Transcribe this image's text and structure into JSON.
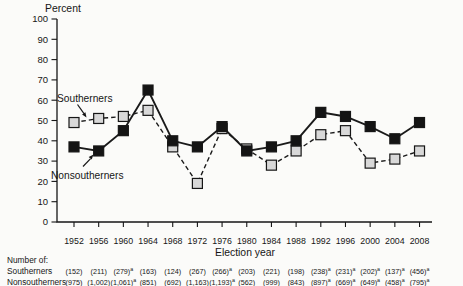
{
  "page": {
    "background": "#fbfbf9",
    "ink_color": "#161616",
    "gray_marker_color": "#d8d8d8"
  },
  "chart_data": {
    "type": "line",
    "title": "",
    "ylabel": "Percent",
    "xlabel": "Election year",
    "ylim": [
      0,
      100
    ],
    "ytick_step": 10,
    "grid": false,
    "legend_position": "inline-annotations",
    "categories": [
      "1952",
      "1956",
      "1960",
      "1964",
      "1968",
      "1972",
      "1976",
      "1980",
      "1984",
      "1988",
      "1992",
      "1996",
      "2000",
      "2004",
      "2008"
    ],
    "series": [
      {
        "name": "Southerners",
        "line_style": "dashed",
        "marker": "square",
        "marker_fill": "#d8d8d8",
        "line_color": "#1a1a1a",
        "values": [
          49,
          51,
          52,
          55,
          37,
          19,
          46,
          36,
          28,
          35,
          43,
          45,
          29,
          31,
          35
        ]
      },
      {
        "name": "Nonsoutherners",
        "line_style": "solid",
        "marker": "square",
        "marker_fill": "#141414",
        "line_color": "#1a1a1a",
        "values": [
          37,
          35,
          45,
          65,
          40,
          37,
          47,
          35,
          37,
          40,
          54,
          52,
          47,
          41,
          49
        ]
      }
    ]
  },
  "footnote_table": {
    "heading": "Number of:",
    "rows": [
      {
        "label": "Southerners",
        "values": [
          {
            "text": "(152)",
            "sup": ""
          },
          {
            "text": "(211)",
            "sup": ""
          },
          {
            "text": "(279)",
            "sup": "a"
          },
          {
            "text": "(163)",
            "sup": ""
          },
          {
            "text": "(124)",
            "sup": ""
          },
          {
            "text": "(267)",
            "sup": ""
          },
          {
            "text": "(266)",
            "sup": "a"
          },
          {
            "text": "(203)",
            "sup": ""
          },
          {
            "text": "(221)",
            "sup": ""
          },
          {
            "text": "(198)",
            "sup": ""
          },
          {
            "text": "(238)",
            "sup": "a"
          },
          {
            "text": "(231)",
            "sup": "a"
          },
          {
            "text": "(202)",
            "sup": "a"
          },
          {
            "text": "(137)",
            "sup": "a"
          },
          {
            "text": "(456)",
            "sup": "a"
          }
        ]
      },
      {
        "label": "Nonsoutherners",
        "values": [
          {
            "text": "(975)",
            "sup": ""
          },
          {
            "text": "(1,002)",
            "sup": ""
          },
          {
            "text": "(1,061)",
            "sup": "a"
          },
          {
            "text": "(851)",
            "sup": ""
          },
          {
            "text": "(692)",
            "sup": ""
          },
          {
            "text": "(1,163)",
            "sup": ""
          },
          {
            "text": "(1,193)",
            "sup": "a"
          },
          {
            "text": "(562)",
            "sup": ""
          },
          {
            "text": "(999)",
            "sup": ""
          },
          {
            "text": "(843)",
            "sup": ""
          },
          {
            "text": "(897)",
            "sup": "a"
          },
          {
            "text": "(669)",
            "sup": "a"
          },
          {
            "text": "(649)",
            "sup": "a"
          },
          {
            "text": "(458)",
            "sup": "a"
          },
          {
            "text": "(795)",
            "sup": "a"
          }
        ]
      }
    ]
  }
}
